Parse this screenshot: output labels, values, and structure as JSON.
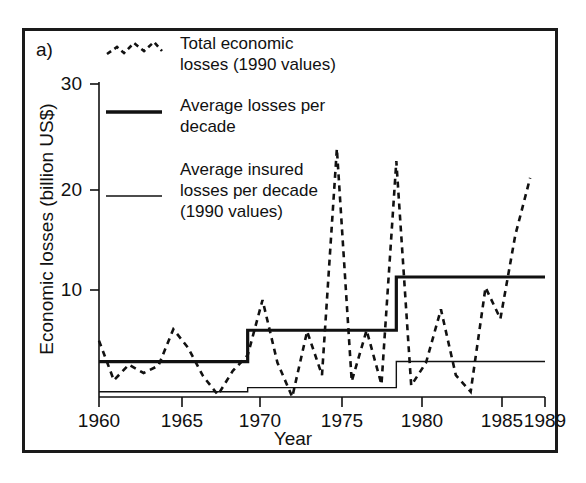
{
  "figure": {
    "panel_label": "a)",
    "y_axis_title": "Economic losses (billion US$)",
    "x_axis_title": "Year"
  },
  "legend": {
    "position": "top-left-inside",
    "entries": [
      {
        "marker": "dashed-line",
        "label": "Total economic\nlosses (1990 values)"
      },
      {
        "marker": "thick-solid-line",
        "label": "Average losses per\ndecade"
      },
      {
        "marker": "thin-solid-line",
        "label": "Average insured\nlosses per decade\n(1990 values)"
      }
    ]
  },
  "axes": {
    "y_ticks": [
      "10",
      "20",
      "30"
    ],
    "x_ticks": [
      "1960",
      "1965",
      "1970",
      "1975",
      "1980",
      "1985",
      "1989"
    ]
  },
  "chart_data": {
    "type": "line",
    "title": "",
    "xlabel": "Year",
    "ylabel": "Economic losses (billion US$)",
    "xlim": [
      1960,
      1990
    ],
    "ylim": [
      0,
      31
    ],
    "ytick_values": [
      10,
      20,
      30
    ],
    "xtick_values": [
      1960,
      1965,
      1970,
      1975,
      1980,
      1985,
      1989
    ],
    "grid": false,
    "legend_position": "upper left",
    "series": [
      {
        "name": "Total economic losses (1990 values)",
        "style": "dashed",
        "x": [
          1960,
          1961,
          1962,
          1963,
          1964,
          1965,
          1966,
          1967,
          1968,
          1969,
          1970,
          1971,
          1972,
          1973,
          1974,
          1975,
          1976,
          1977,
          1978,
          1979,
          1980,
          1981,
          1982,
          1983,
          1984,
          1985,
          1986,
          1987,
          1988,
          1989
        ],
        "values": [
          5.4,
          1.6,
          3.1,
          2.3,
          3.0,
          6.5,
          4.7,
          2.0,
          0.2,
          2.5,
          4.0,
          9.3,
          3.3,
          0.0,
          6.3,
          2.1,
          23.8,
          1.5,
          6.4,
          1.2,
          22.6,
          1.1,
          3.3,
          8.4,
          2.1,
          0.5,
          10.5,
          7.5,
          15.5,
          21.0
        ]
      },
      {
        "name": "Average losses per decade",
        "style": "thick-step",
        "steps": [
          {
            "start": 1960,
            "end": 1970,
            "value": 3.4
          },
          {
            "start": 1970,
            "end": 1980,
            "value": 6.4
          },
          {
            "start": 1980,
            "end": 1990,
            "value": 11.5
          }
        ]
      },
      {
        "name": "Average insured losses per decade (1990 values)",
        "style": "thin-step",
        "steps": [
          {
            "start": 1960,
            "end": 1970,
            "value": 0.5
          },
          {
            "start": 1970,
            "end": 1980,
            "value": 0.9
          },
          {
            "start": 1980,
            "end": 1990,
            "value": 3.4
          }
        ]
      }
    ]
  },
  "colors": {
    "frame": "#1a1a1a",
    "line": "#111111",
    "background": "#ffffff"
  }
}
